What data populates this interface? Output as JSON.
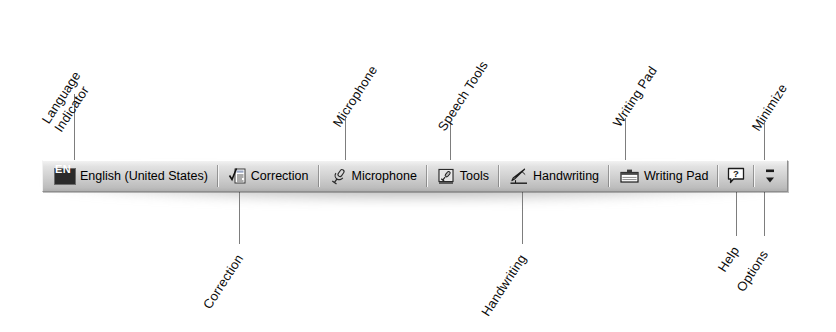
{
  "toolbar": {
    "name": "Language Bar",
    "language_indicator": {
      "code": "EN",
      "label": "English (United States)"
    },
    "items": [
      {
        "icon": "correction-icon",
        "label": "Correction"
      },
      {
        "icon": "microphone-icon",
        "label": "Microphone"
      },
      {
        "icon": "speech-tools-icon",
        "label": "Tools"
      },
      {
        "icon": "handwriting-icon",
        "label": "Handwriting"
      },
      {
        "icon": "writing-pad-icon",
        "label": "Writing Pad"
      }
    ],
    "help_button": {
      "icon": "help-icon",
      "label": "?"
    },
    "options_button": {
      "icon": "options-icon",
      "label": ""
    }
  },
  "callouts": {
    "top": [
      {
        "key": "language-indicator",
        "line1": "Language",
        "line2": "Indicator"
      },
      {
        "key": "microphone",
        "line1": "Microphone",
        "line2": ""
      },
      {
        "key": "speech-tools",
        "line1": "Speech Tools",
        "line2": ""
      },
      {
        "key": "writing-pad",
        "line1": "Writing Pad",
        "line2": ""
      },
      {
        "key": "minimize",
        "line1": "Minimize",
        "line2": ""
      }
    ],
    "bottom": [
      {
        "key": "correction",
        "line1": "Correction"
      },
      {
        "key": "handwriting",
        "line1": "Handwriting"
      },
      {
        "key": "help",
        "line1": "Help"
      },
      {
        "key": "options",
        "line1": "Options"
      }
    ]
  },
  "colors": {
    "bar_face": "#cfcfcf",
    "bar_border": "#8e8e8e",
    "chip_bg": "#2b2b2b",
    "chip_fg": "#ffffff",
    "leader": "#7d7d7d",
    "text": "#0c0c0c"
  }
}
